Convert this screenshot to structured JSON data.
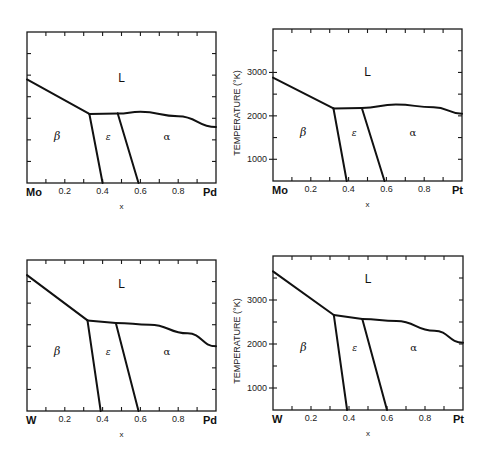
{
  "figure": {
    "panels": [
      {
        "id": "mo-pd",
        "left_element": "Mo",
        "right_element": "Pd",
        "xlabel": "x",
        "ylabel": "",
        "show_y_ticks": false
      },
      {
        "id": "mo-pt",
        "left_element": "Mo",
        "right_element": "Pt",
        "xlabel": "x",
        "ylabel": "TEMPERATURE (°K)",
        "show_y_ticks": true
      },
      {
        "id": "w-pd",
        "left_element": "W",
        "right_element": "Pd",
        "xlabel": "x",
        "ylabel": "",
        "show_y_ticks": false
      },
      {
        "id": "w-pt",
        "left_element": "W",
        "right_element": "Pt",
        "xlabel": "x",
        "ylabel": "TEMPERATURE (°K)",
        "show_y_ticks": true
      }
    ],
    "x_tick_labels": [
      "0.2",
      "0.4",
      "0.6",
      "0.8"
    ],
    "y_tick_labels": [
      "1000",
      "2000",
      "3000"
    ],
    "phase_labels": {
      "liquid": "L",
      "beta": "β",
      "epsilon": "ε",
      "alpha": "α"
    }
  },
  "chart_data": [
    {
      "type": "line",
      "title": "Mo–Pd phase diagram",
      "xlabel": "x",
      "ylabel": "Temperature (K)",
      "xlim": [
        0,
        1
      ],
      "ylim": [
        500,
        4000
      ],
      "x_tick_labels": [
        "Mo",
        "0.2",
        "0.4",
        "0.6",
        "0.8",
        "Pd"
      ],
      "series": [
        {
          "name": "liquidus (β)",
          "x": [
            0,
            0.33
          ],
          "y": [
            2900,
            2100
          ]
        },
        {
          "name": "ε top",
          "x": [
            0.33,
            0.48
          ],
          "y": [
            2100,
            2110
          ]
        },
        {
          "name": "liquidus (α)",
          "x": [
            0.48,
            0.6,
            0.8,
            1.0
          ],
          "y": [
            2110,
            2150,
            2050,
            1800
          ]
        },
        {
          "name": "β/ε boundary",
          "x": [
            0.33,
            0.4
          ],
          "y": [
            2100,
            500
          ]
        },
        {
          "name": "ε/α boundary",
          "x": [
            0.48,
            0.59
          ],
          "y": [
            2110,
            500
          ]
        }
      ],
      "regions": [
        "L",
        "β",
        "ε",
        "α"
      ],
      "grid": false
    },
    {
      "type": "line",
      "title": "Mo–Pt phase diagram",
      "xlabel": "x",
      "ylabel": "TEMPERATURE (°K)",
      "xlim": [
        0,
        1
      ],
      "ylim": [
        500,
        4000
      ],
      "y_ticks": [
        1000,
        2000,
        3000
      ],
      "x_tick_labels": [
        "Mo",
        "0.2",
        "0.4",
        "0.6",
        "0.8",
        "Pt"
      ],
      "series": [
        {
          "name": "liquidus (β)",
          "x": [
            0,
            0.32
          ],
          "y": [
            2880,
            2170
          ]
        },
        {
          "name": "ε top",
          "x": [
            0.32,
            0.47
          ],
          "y": [
            2170,
            2180
          ]
        },
        {
          "name": "liquidus (α)",
          "x": [
            0.47,
            0.65,
            0.85,
            1.0
          ],
          "y": [
            2180,
            2260,
            2200,
            2050
          ]
        },
        {
          "name": "β/ε boundary",
          "x": [
            0.32,
            0.39
          ],
          "y": [
            2170,
            500
          ]
        },
        {
          "name": "ε/α boundary",
          "x": [
            0.47,
            0.59
          ],
          "y": [
            2180,
            500
          ]
        }
      ],
      "regions": [
        "L",
        "β",
        "ε",
        "α"
      ],
      "grid": false
    },
    {
      "type": "line",
      "title": "W–Pd phase diagram",
      "xlabel": "x",
      "ylabel": "Temperature (K)",
      "xlim": [
        0,
        1
      ],
      "ylim": [
        500,
        4000
      ],
      "x_tick_labels": [
        "W",
        "0.2",
        "0.4",
        "0.6",
        "0.8",
        "Pd"
      ],
      "series": [
        {
          "name": "liquidus (β)",
          "x": [
            0,
            0.32
          ],
          "y": [
            3650,
            2600
          ]
        },
        {
          "name": "ε top",
          "x": [
            0.32,
            0.47
          ],
          "y": [
            2600,
            2540
          ]
        },
        {
          "name": "liquidus (α)",
          "x": [
            0.47,
            0.65,
            0.85,
            1.0
          ],
          "y": [
            2540,
            2500,
            2300,
            2000
          ]
        },
        {
          "name": "β/ε boundary",
          "x": [
            0.32,
            0.39
          ],
          "y": [
            2600,
            500
          ]
        },
        {
          "name": "ε/α boundary",
          "x": [
            0.47,
            0.59
          ],
          "y": [
            2540,
            500
          ]
        }
      ],
      "regions": [
        "L",
        "β",
        "ε",
        "α"
      ],
      "grid": false
    },
    {
      "type": "line",
      "title": "W–Pt phase diagram",
      "xlabel": "x",
      "ylabel": "TEMPERATURE (°K)",
      "xlim": [
        0,
        1
      ],
      "ylim": [
        500,
        4000
      ],
      "y_ticks": [
        1000,
        2000,
        3000
      ],
      "x_tick_labels": [
        "W",
        "0.2",
        "0.4",
        "0.6",
        "0.8",
        "Pt"
      ],
      "series": [
        {
          "name": "liquidus (β)",
          "x": [
            0,
            0.32
          ],
          "y": [
            3650,
            2660
          ]
        },
        {
          "name": "ε top",
          "x": [
            0.32,
            0.47
          ],
          "y": [
            2660,
            2570
          ]
        },
        {
          "name": "liquidus (α)",
          "x": [
            0.47,
            0.65,
            0.85,
            1.0
          ],
          "y": [
            2570,
            2520,
            2300,
            2030
          ]
        },
        {
          "name": "β/ε boundary",
          "x": [
            0.32,
            0.39
          ],
          "y": [
            2660,
            500
          ]
        },
        {
          "name": "ε/α boundary",
          "x": [
            0.47,
            0.6
          ],
          "y": [
            2570,
            500
          ]
        }
      ],
      "regions": [
        "L",
        "β",
        "ε",
        "α"
      ],
      "grid": false
    }
  ]
}
